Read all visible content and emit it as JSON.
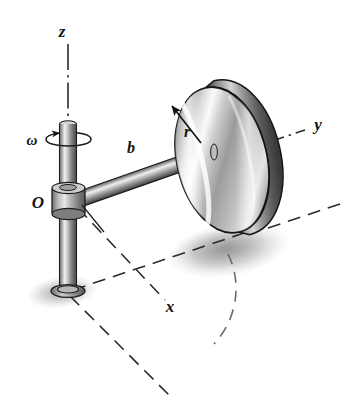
{
  "figure": {
    "background_color": "#ffffff",
    "ink_color": "#141414"
  },
  "axes": [
    {
      "name": "z",
      "label": "z",
      "line_style": "dash-dot",
      "direction": "vertical-up",
      "label_x": 62,
      "label_y": 35
    },
    {
      "name": "y",
      "label": "y",
      "line_style": "dash-dot",
      "direction": "upper-right",
      "label_x": 316,
      "label_y": 124
    },
    {
      "name": "x",
      "label": "x",
      "line_style": "dashed",
      "direction": "lower-right",
      "label_x": 168,
      "label_y": 310
    }
  ],
  "labels": {
    "origin": "O",
    "arm_length": "b",
    "disk_radius": "r",
    "angular_velocity": "ω"
  },
  "components": [
    {
      "name": "vertical-shaft",
      "label": "vertical shaft"
    },
    {
      "name": "hub-collar",
      "label": "hub collar at O"
    },
    {
      "name": "horizontal-arm",
      "label": "arm of length b"
    },
    {
      "name": "disk",
      "label": "disk of radius r"
    },
    {
      "name": "shaft-base-ring",
      "label": "base ring"
    },
    {
      "name": "rotation-ellipse",
      "label": "omega rotation indicator"
    },
    {
      "name": "ground-shadow-shaft",
      "label": "shadow under shaft"
    },
    {
      "name": "ground-shadow-disk",
      "label": "shadow under disk"
    },
    {
      "name": "path-arc",
      "label": "dashed circular path arc"
    }
  ],
  "colors": {
    "ink": "#141414",
    "metal_light": "#f2f2f2",
    "metal_mid": "#b4b4b4",
    "metal_dark": "#595959",
    "metal_darkest": "#343434",
    "shadow": "#a8a8a8",
    "dash": "#2b2b2b"
  }
}
